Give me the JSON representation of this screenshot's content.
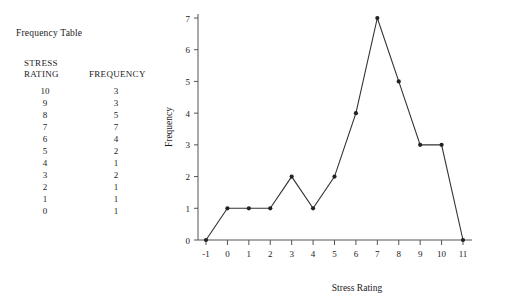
{
  "table": {
    "title": "Frequency Table",
    "header_col1_line1": "STRESS",
    "header_col1_line2": "RATING",
    "header_col2": "FREQUENCY",
    "rows": [
      {
        "rating": "10",
        "frequency": "3"
      },
      {
        "rating": "9",
        "frequency": "3"
      },
      {
        "rating": "8",
        "frequency": "5"
      },
      {
        "rating": "7",
        "frequency": "7"
      },
      {
        "rating": "6",
        "frequency": "4"
      },
      {
        "rating": "5",
        "frequency": "2"
      },
      {
        "rating": "4",
        "frequency": "1"
      },
      {
        "rating": "3",
        "frequency": "2"
      },
      {
        "rating": "2",
        "frequency": "1"
      },
      {
        "rating": "1",
        "frequency": "1"
      },
      {
        "rating": "0",
        "frequency": "1"
      }
    ]
  },
  "chart_data": {
    "type": "line",
    "title": "",
    "xlabel": "Stress Rating",
    "ylabel": "Frequency",
    "x": [
      -1,
      0,
      1,
      2,
      3,
      4,
      5,
      6,
      7,
      8,
      9,
      10,
      11
    ],
    "values": [
      0,
      1,
      1,
      1,
      2,
      1,
      2,
      4,
      7,
      5,
      3,
      3,
      0
    ],
    "xticks": [
      "-1",
      "0",
      "1",
      "2",
      "3",
      "4",
      "5",
      "6",
      "7",
      "8",
      "9",
      "10",
      "11"
    ],
    "yticks": [
      "0",
      "1",
      "2",
      "3",
      "4",
      "5",
      "6",
      "7"
    ],
    "xlim": [
      -1,
      11
    ],
    "ylim": [
      0,
      7
    ],
    "grid": false,
    "legend": "none",
    "markers": true,
    "line_color": "#333333",
    "marker_color": "#222222",
    "axis_color": "#555555"
  }
}
